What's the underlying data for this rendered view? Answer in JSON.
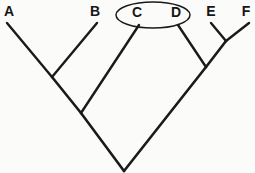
{
  "diagram": {
    "kind": "cladogram",
    "background_color": "#fbfbfa",
    "line_color": "#1a1a1a",
    "label_color": "#161616",
    "width": 255,
    "height": 173,
    "taxa": [
      {
        "id": "A",
        "label": "A",
        "label_x": 9,
        "label_y": 16,
        "tip_x": 7,
        "tip_y": 23
      },
      {
        "id": "B",
        "label": "B",
        "label_x": 95,
        "label_y": 16,
        "tip_x": 97,
        "tip_y": 23
      },
      {
        "id": "C",
        "label": "C",
        "label_x": 137,
        "label_y": 17,
        "tip_x": 139,
        "tip_y": 25
      },
      {
        "id": "D",
        "label": "D",
        "label_x": 176,
        "label_y": 17,
        "tip_x": 178,
        "tip_y": 25
      },
      {
        "id": "E",
        "label": "E",
        "label_x": 211,
        "label_y": 16,
        "tip_x": 211,
        "tip_y": 23
      },
      {
        "id": "F",
        "label": "F",
        "label_x": 246,
        "label_y": 16,
        "tip_x": 249,
        "tip_y": 23
      }
    ],
    "nodes": [
      {
        "id": "node-ab",
        "x": 52,
        "y": 77
      },
      {
        "id": "node-abc",
        "x": 81,
        "y": 113
      },
      {
        "id": "node-ef",
        "x": 226,
        "y": 41
      },
      {
        "id": "node-def",
        "x": 206,
        "y": 67
      },
      {
        "id": "node-root",
        "x": 124,
        "y": 171
      }
    ],
    "branches": [
      {
        "id": "branch-a",
        "from": "A",
        "to": "node-ab",
        "x1": 7,
        "y1": 23,
        "x2": 52,
        "y2": 77
      },
      {
        "id": "branch-b",
        "from": "B",
        "to": "node-ab",
        "x1": 97,
        "y1": 23,
        "x2": 52,
        "y2": 77
      },
      {
        "id": "branch-ab",
        "from": "node-ab",
        "to": "node-abc",
        "x1": 52,
        "y1": 77,
        "x2": 81,
        "y2": 113
      },
      {
        "id": "branch-c",
        "from": "C",
        "to": "node-abc",
        "x1": 139,
        "y1": 25,
        "x2": 81,
        "y2": 113
      },
      {
        "id": "branch-abc",
        "from": "node-abc",
        "to": "node-root",
        "x1": 81,
        "y1": 113,
        "x2": 124,
        "y2": 171
      },
      {
        "id": "branch-e",
        "from": "E",
        "to": "node-ef",
        "x1": 211,
        "y1": 23,
        "x2": 226,
        "y2": 41
      },
      {
        "id": "branch-f",
        "from": "F",
        "to": "node-ef",
        "x1": 249,
        "y1": 23,
        "x2": 226,
        "y2": 41
      },
      {
        "id": "branch-ef",
        "from": "node-ef",
        "to": "node-def",
        "x1": 226,
        "y1": 41,
        "x2": 206,
        "y2": 67
      },
      {
        "id": "branch-d",
        "from": "D",
        "to": "node-def",
        "x1": 178,
        "y1": 25,
        "x2": 206,
        "y2": 67
      },
      {
        "id": "branch-def",
        "from": "node-def",
        "to": "node-root",
        "x1": 206,
        "y1": 67,
        "x2": 124,
        "y2": 171
      }
    ],
    "highlight": {
      "id": "clade-cd-ellipse",
      "encircled_taxa": "C, D",
      "cx": 153,
      "cy": 15,
      "rx": 37,
      "ry": 13
    }
  }
}
